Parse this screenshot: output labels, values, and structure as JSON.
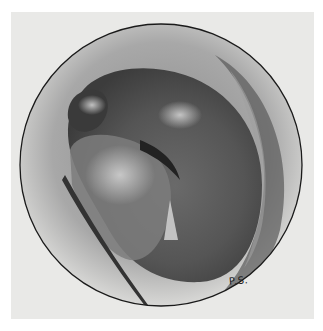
{
  "image": {
    "description": "Circular pencil illustration of a rounded curved anatomical structure with highlights, shading and folds",
    "signature": "P.S.",
    "colors": {
      "background": "#ffffff",
      "paper": "#e9e9e7",
      "outline": "#1a1a1a",
      "dark_tone": "#3a3a3a",
      "mid_tone": "#707070",
      "highlight": "#c8c8c8"
    }
  }
}
